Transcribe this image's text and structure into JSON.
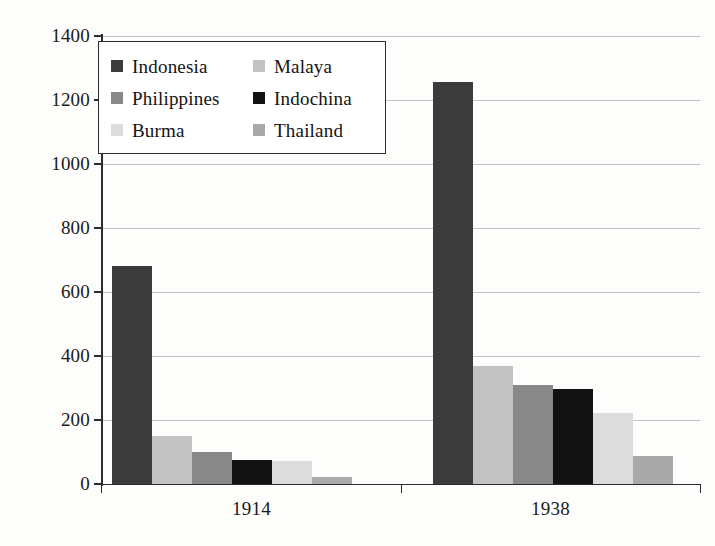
{
  "chart_data": {
    "type": "bar",
    "title": "",
    "xlabel": "",
    "ylabel": "",
    "categories": [
      "1914",
      "1938"
    ],
    "ylim": [
      0,
      1400
    ],
    "ytick_step": 200,
    "yticks": [
      "0",
      "200",
      "400",
      "600",
      "800",
      "1000",
      "1200",
      "1400"
    ],
    "grid": true,
    "legend_position": "upper-left-inside",
    "series": [
      {
        "name": "Indonesia",
        "color": "#3b3b3b",
        "values": [
          681,
          1256
        ]
      },
      {
        "name": "Malaya",
        "color": "#c2c2c2",
        "values": [
          150,
          369
        ]
      },
      {
        "name": "Philippines",
        "color": "#888888",
        "values": [
          100,
          310
        ]
      },
      {
        "name": "Indochina",
        "color": "#121212",
        "values": [
          75,
          297
        ]
      },
      {
        "name": "Burma",
        "color": "#dcdcdc",
        "values": [
          72,
          222
        ]
      },
      {
        "name": "Thailand",
        "color": "#a9a9a9",
        "values": [
          22,
          88
        ]
      }
    ]
  },
  "legend": {
    "entries": [
      {
        "label": "Indonesia",
        "swatch": "#3b3b3b"
      },
      {
        "label": "Malaya",
        "swatch": "#c2c2c2"
      },
      {
        "label": "Philippines",
        "swatch": "#888888"
      },
      {
        "label": "Indochina",
        "swatch": "#121212"
      },
      {
        "label": "Burma",
        "swatch": "#dcdcdc"
      },
      {
        "label": "Thailand",
        "swatch": "#a9a9a9"
      }
    ]
  },
  "axis": {
    "y_labels": [
      "1400",
      "1200",
      "1000",
      "800",
      "600",
      "400",
      "200",
      "0"
    ],
    "x_labels": [
      "1914",
      "1938"
    ]
  },
  "colors": {
    "gridline": "#b9b9b9",
    "axis": "#2c2c2c",
    "background": "#fdfdfc",
    "text": "#1a1a1a"
  }
}
